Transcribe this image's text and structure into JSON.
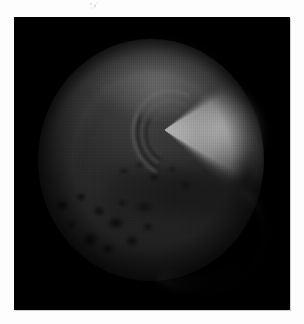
{
  "figure": {
    "kind": "grayscale-planetary-disc-image",
    "caption": "",
    "panel": {
      "background_color": "#000000",
      "left": 14,
      "top": 17,
      "width": 276,
      "height": 293
    },
    "page_background_color": "#fdfdfd"
  },
  "chart_data": {
    "type": "heatmap",
    "title": "",
    "subtitle": "",
    "xlabel": "",
    "ylabel": "",
    "colormap": "grayscale",
    "grid": false,
    "legend": "none",
    "background": "#000000",
    "features": [
      {
        "name": "planetary-disc",
        "shape": "ellipse",
        "center_x": 137,
        "center_y": 143,
        "radius_x": 113,
        "radius_y": 121,
        "mean_gray": "#242424"
      },
      {
        "name": "bright-fan-plume",
        "shape": "wedge",
        "apex_x": 150,
        "apex_y": 113,
        "opening_deg": 74,
        "bearing_deg": 85,
        "extent_px": 110,
        "peak_gray": "#b9b9b9"
      },
      {
        "name": "concentric-arcs",
        "shape": "arcs",
        "center_x": 160,
        "center_y": 114,
        "radii_px": [
          21,
          29,
          38
        ],
        "gray": "#8f8f8f"
      },
      {
        "name": "upper-limb-glow",
        "shape": "arc",
        "center_x": 143,
        "center_y": 60,
        "gray": "#9b9b9b"
      },
      {
        "name": "crater-field",
        "shape": "mottled-region",
        "bounds_x": [
          30,
          166
        ],
        "bounds_y": [
          160,
          270
        ],
        "gray": "#0d0d0d"
      },
      {
        "name": "lower-right-limb-arc",
        "shape": "arc",
        "center_x": 182,
        "center_y": 213,
        "gray": "#878787"
      }
    ],
    "gray_levels": {
      "sky_background": "#000000",
      "disc_body": "#242424",
      "disc_shadow": "#0d0d0d",
      "limb_glow": "#6a6a6a",
      "plume_bright": "#b9b9b9",
      "plume_core": "#c8c8c8"
    },
    "axis_ranges": {
      "x": [
        0,
        276
      ],
      "y": [
        0,
        293
      ]
    }
  },
  "artifacts": {
    "scan_speck_label": "scan-speck"
  }
}
